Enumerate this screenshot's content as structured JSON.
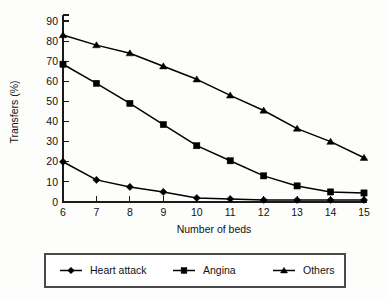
{
  "chart_data": {
    "type": "line",
    "title": "",
    "subtitle": "",
    "xlabel": "Number of beds",
    "ylabel": "Transfers (%)",
    "x": [
      6,
      7,
      8,
      9,
      10,
      11,
      12,
      13,
      14,
      15
    ],
    "categories": [
      "6",
      "7",
      "8",
      "9",
      "10",
      "11",
      "12",
      "13",
      "14",
      "15"
    ],
    "xlim": [
      6,
      15
    ],
    "ylim": [
      0,
      90
    ],
    "yticks": [
      0,
      10,
      20,
      30,
      40,
      50,
      60,
      70,
      80,
      90
    ],
    "ytick_labels": [
      "0",
      "10",
      "20",
      "30",
      "40",
      "50",
      "60",
      "70",
      "80",
      "90"
    ],
    "xticks": [
      6,
      7,
      8,
      9,
      10,
      11,
      12,
      13,
      14,
      15
    ],
    "xtick_labels": [
      "6",
      "7",
      "8",
      "9",
      "10",
      "11",
      "12",
      "13",
      "14",
      "15"
    ],
    "grid": false,
    "legend_position": "bottom",
    "series": [
      {
        "name": "Heart attack",
        "marker": "diamond",
        "color": "#000000",
        "values": [
          20,
          11,
          7.5,
          5,
          2,
          1.5,
          1,
          1,
          1,
          1
        ]
      },
      {
        "name": "Angina",
        "marker": "square",
        "color": "#000000",
        "values": [
          68.5,
          59,
          49,
          38.5,
          28,
          20.5,
          13,
          8,
          5,
          4.5
        ]
      },
      {
        "name": "Others",
        "marker": "triangle",
        "color": "#000000",
        "values": [
          83,
          78,
          74,
          67.5,
          61,
          53,
          45.5,
          36.5,
          30,
          22
        ]
      }
    ]
  },
  "legend": {
    "entries": [
      {
        "label": "Heart attack",
        "marker": "diamond"
      },
      {
        "label": "Angina",
        "marker": "square"
      },
      {
        "label": "Others",
        "marker": "triangle"
      }
    ]
  },
  "colors": {
    "ink": "#000000",
    "background": "#fdfdfb",
    "legend_border": "#4a4a4a"
  }
}
